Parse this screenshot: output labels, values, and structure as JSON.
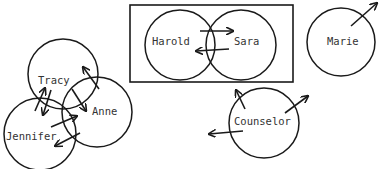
{
  "diagram": {
    "type": "sociogram",
    "colors": {
      "stroke": "#1a1a1a",
      "text": "#333333",
      "background": "#ffffff"
    },
    "nodes": [
      {
        "id": "tracy",
        "label": "Tracy",
        "cx": 63,
        "cy": 74,
        "r": 35,
        "lx": 38,
        "ly": 84
      },
      {
        "id": "anne",
        "label": "Anne",
        "cx": 97,
        "cy": 112,
        "r": 35,
        "lx": 92,
        "ly": 115
      },
      {
        "id": "jennifer",
        "label": "Jennifer",
        "cx": 40,
        "cy": 134,
        "r": 36,
        "lx": 6,
        "ly": 140
      },
      {
        "id": "harold",
        "label": "Harold",
        "cx": 180,
        "cy": 45,
        "r": 35,
        "lx": 152,
        "ly": 45
      },
      {
        "id": "sara",
        "label": "Sara",
        "cx": 241,
        "cy": 45,
        "r": 35,
        "lx": 234,
        "ly": 45
      },
      {
        "id": "marie",
        "label": "Marie",
        "cx": 341,
        "cy": 42,
        "r": 34,
        "lx": 327,
        "ly": 45
      },
      {
        "id": "counselor",
        "label": "Counselor",
        "cx": 264,
        "cy": 123,
        "r": 35,
        "lx": 234,
        "ly": 125
      }
    ],
    "group_box": {
      "x": 130,
      "y": 5,
      "width": 163,
      "height": 77,
      "members": [
        "harold",
        "sara"
      ]
    },
    "arrows": [
      {
        "from": "harold",
        "to": "sara",
        "x1": 200,
        "y1": 31,
        "x2": 233,
        "y2": 31
      },
      {
        "from": "sara",
        "to": "harold",
        "x1": 229,
        "y1": 49,
        "x2": 196,
        "y2": 51
      },
      {
        "from": "anne",
        "to": "tracy",
        "x1": 99,
        "y1": 89,
        "x2": 83,
        "y2": 67
      },
      {
        "from": "tracy",
        "to": "anne",
        "x1": 72,
        "y1": 89,
        "x2": 86,
        "y2": 111
      },
      {
        "from": "jennifer",
        "to": "tracy",
        "x1": 35,
        "y1": 111,
        "x2": 45,
        "y2": 88
      },
      {
        "from": "tracy",
        "to": "jennifer",
        "x1": 51,
        "y1": 90,
        "x2": 43,
        "y2": 115
      },
      {
        "from": "jennifer",
        "to": "anne",
        "x1": 51,
        "y1": 127,
        "x2": 77,
        "y2": 116
      },
      {
        "from": "anne",
        "to": "jennifer",
        "x1": 80,
        "y1": 133,
        "x2": 55,
        "y2": 146
      },
      {
        "from": "marie",
        "to": "out",
        "x1": 351,
        "y1": 26,
        "x2": 377,
        "y2": 3
      },
      {
        "from": "counselor",
        "to": "up-left",
        "x1": 245,
        "y1": 109,
        "x2": 236,
        "y2": 90
      },
      {
        "from": "counselor",
        "to": "up-right",
        "x1": 285,
        "y1": 113,
        "x2": 308,
        "y2": 96
      },
      {
        "from": "counselor",
        "to": "left",
        "x1": 243,
        "y1": 131,
        "x2": 209,
        "y2": 134
      }
    ]
  }
}
